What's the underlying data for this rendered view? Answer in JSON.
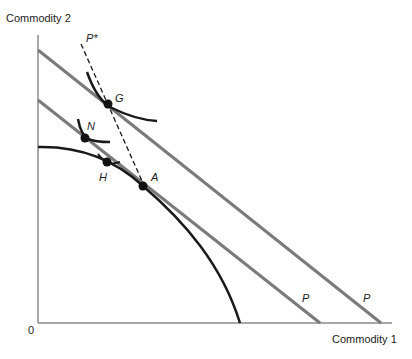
{
  "diagram": {
    "title": "",
    "y_axis_label": "Commodity 2",
    "x_axis_label": "Commodity 1",
    "origin_label": "0",
    "price_line_label_inner": "P",
    "price_line_label_outer": "P",
    "price_line_star_label": "P*",
    "points": [
      {
        "id": "G",
        "label": "G"
      },
      {
        "id": "N",
        "label": "N"
      },
      {
        "id": "H",
        "label": "H"
      },
      {
        "id": "A",
        "label": "A"
      }
    ],
    "colors": {
      "axis": "#888888",
      "price_line": "#7a7a7a",
      "curve": "#1a1a1a",
      "dashed_line": "#1a1a1a",
      "point": "#111111"
    }
  }
}
